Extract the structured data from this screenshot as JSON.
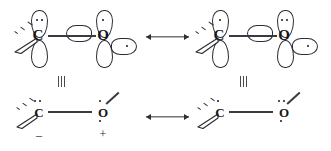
{
  "diagram": {
    "background_color": "#ffffff",
    "ink_color": "#17171c"
  },
  "symbols": {
    "equivalence": "≡",
    "minus_charge": "–",
    "plus_charge": "+",
    "resonance_arrow": "⟷"
  },
  "top_row": {
    "left_structure": {
      "name": "orbital-structure-left",
      "atoms": [
        {
          "label": "C",
          "role": "carbon"
        },
        {
          "label": "O",
          "role": "oxygen"
        }
      ],
      "carbon_orbitals": [
        {
          "position": "up",
          "electrons": 2
        },
        {
          "position": "down",
          "electrons": 0
        }
      ],
      "oxygen_orbitals": [
        {
          "position": "up",
          "electrons": 1
        },
        {
          "position": "down",
          "electrons": 0
        },
        {
          "position": "left",
          "electrons": 0
        },
        {
          "position": "right",
          "electrons": 1
        }
      ],
      "bonds": [
        "dashed",
        "wedge",
        "sigma"
      ]
    },
    "right_structure": {
      "name": "orbital-structure-right",
      "atoms": [
        {
          "label": "C",
          "role": "carbon"
        },
        {
          "label": "O",
          "role": "oxygen"
        }
      ],
      "carbon_orbitals": [
        {
          "position": "up",
          "electrons": 1
        },
        {
          "position": "down",
          "electrons": 0
        }
      ],
      "oxygen_orbitals": [
        {
          "position": "up",
          "electrons": 2
        },
        {
          "position": "down",
          "electrons": 0
        },
        {
          "position": "left",
          "electrons": 0
        },
        {
          "position": "right",
          "electrons": 1
        }
      ],
      "bonds": [
        "dashed",
        "wedge",
        "sigma"
      ]
    }
  },
  "bottom_row": {
    "left_structure": {
      "name": "lewis-structure-left",
      "atoms": [
        {
          "label": "C",
          "role": "carbon",
          "lone_pair_dots": 2,
          "lower_dots": 0,
          "charge": "–"
        },
        {
          "label": "O",
          "role": "oxygen",
          "lone_pair_dots": 1,
          "lower_dots": 1,
          "charge": "+"
        }
      ],
      "bonds": [
        "dashed",
        "wedge",
        "sigma",
        "line"
      ]
    },
    "right_structure": {
      "name": "lewis-structure-right",
      "atoms": [
        {
          "label": "C",
          "role": "carbon",
          "lone_pair_dots": 1,
          "lower_dots": 0,
          "charge": ""
        },
        {
          "label": "O",
          "role": "oxygen",
          "lone_pair_dots": 2,
          "lower_dots": 1,
          "charge": ""
        }
      ],
      "bonds": [
        "dashed",
        "wedge",
        "sigma",
        "line"
      ]
    }
  }
}
